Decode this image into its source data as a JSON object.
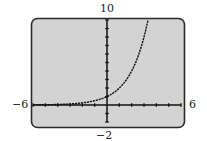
{
  "chart_data": {
    "type": "line",
    "title": "",
    "xlabel": "",
    "ylabel": "",
    "xlim": [
      -6,
      6
    ],
    "ylim": [
      -2,
      10
    ],
    "xscale": 1,
    "yscale": 1,
    "grid": false,
    "legend": null,
    "window_labels": {
      "xmin": "−6",
      "xmax": "6",
      "ymax": "10",
      "ymin": "−2"
    },
    "series": [
      {
        "name": "y = 2^x",
        "x": [
          -6,
          -5,
          -4,
          -3,
          -2,
          -1,
          0,
          1,
          2,
          3,
          3.32
        ],
        "y": [
          0.016,
          0.031,
          0.063,
          0.125,
          0.25,
          0.5,
          1,
          2,
          4,
          8,
          10
        ]
      }
    ]
  },
  "style": {
    "screen_bg": "#d3d3d3",
    "screen_border": "#2a2a2a",
    "axis_color": "#111111",
    "curve_color": "#111111"
  }
}
